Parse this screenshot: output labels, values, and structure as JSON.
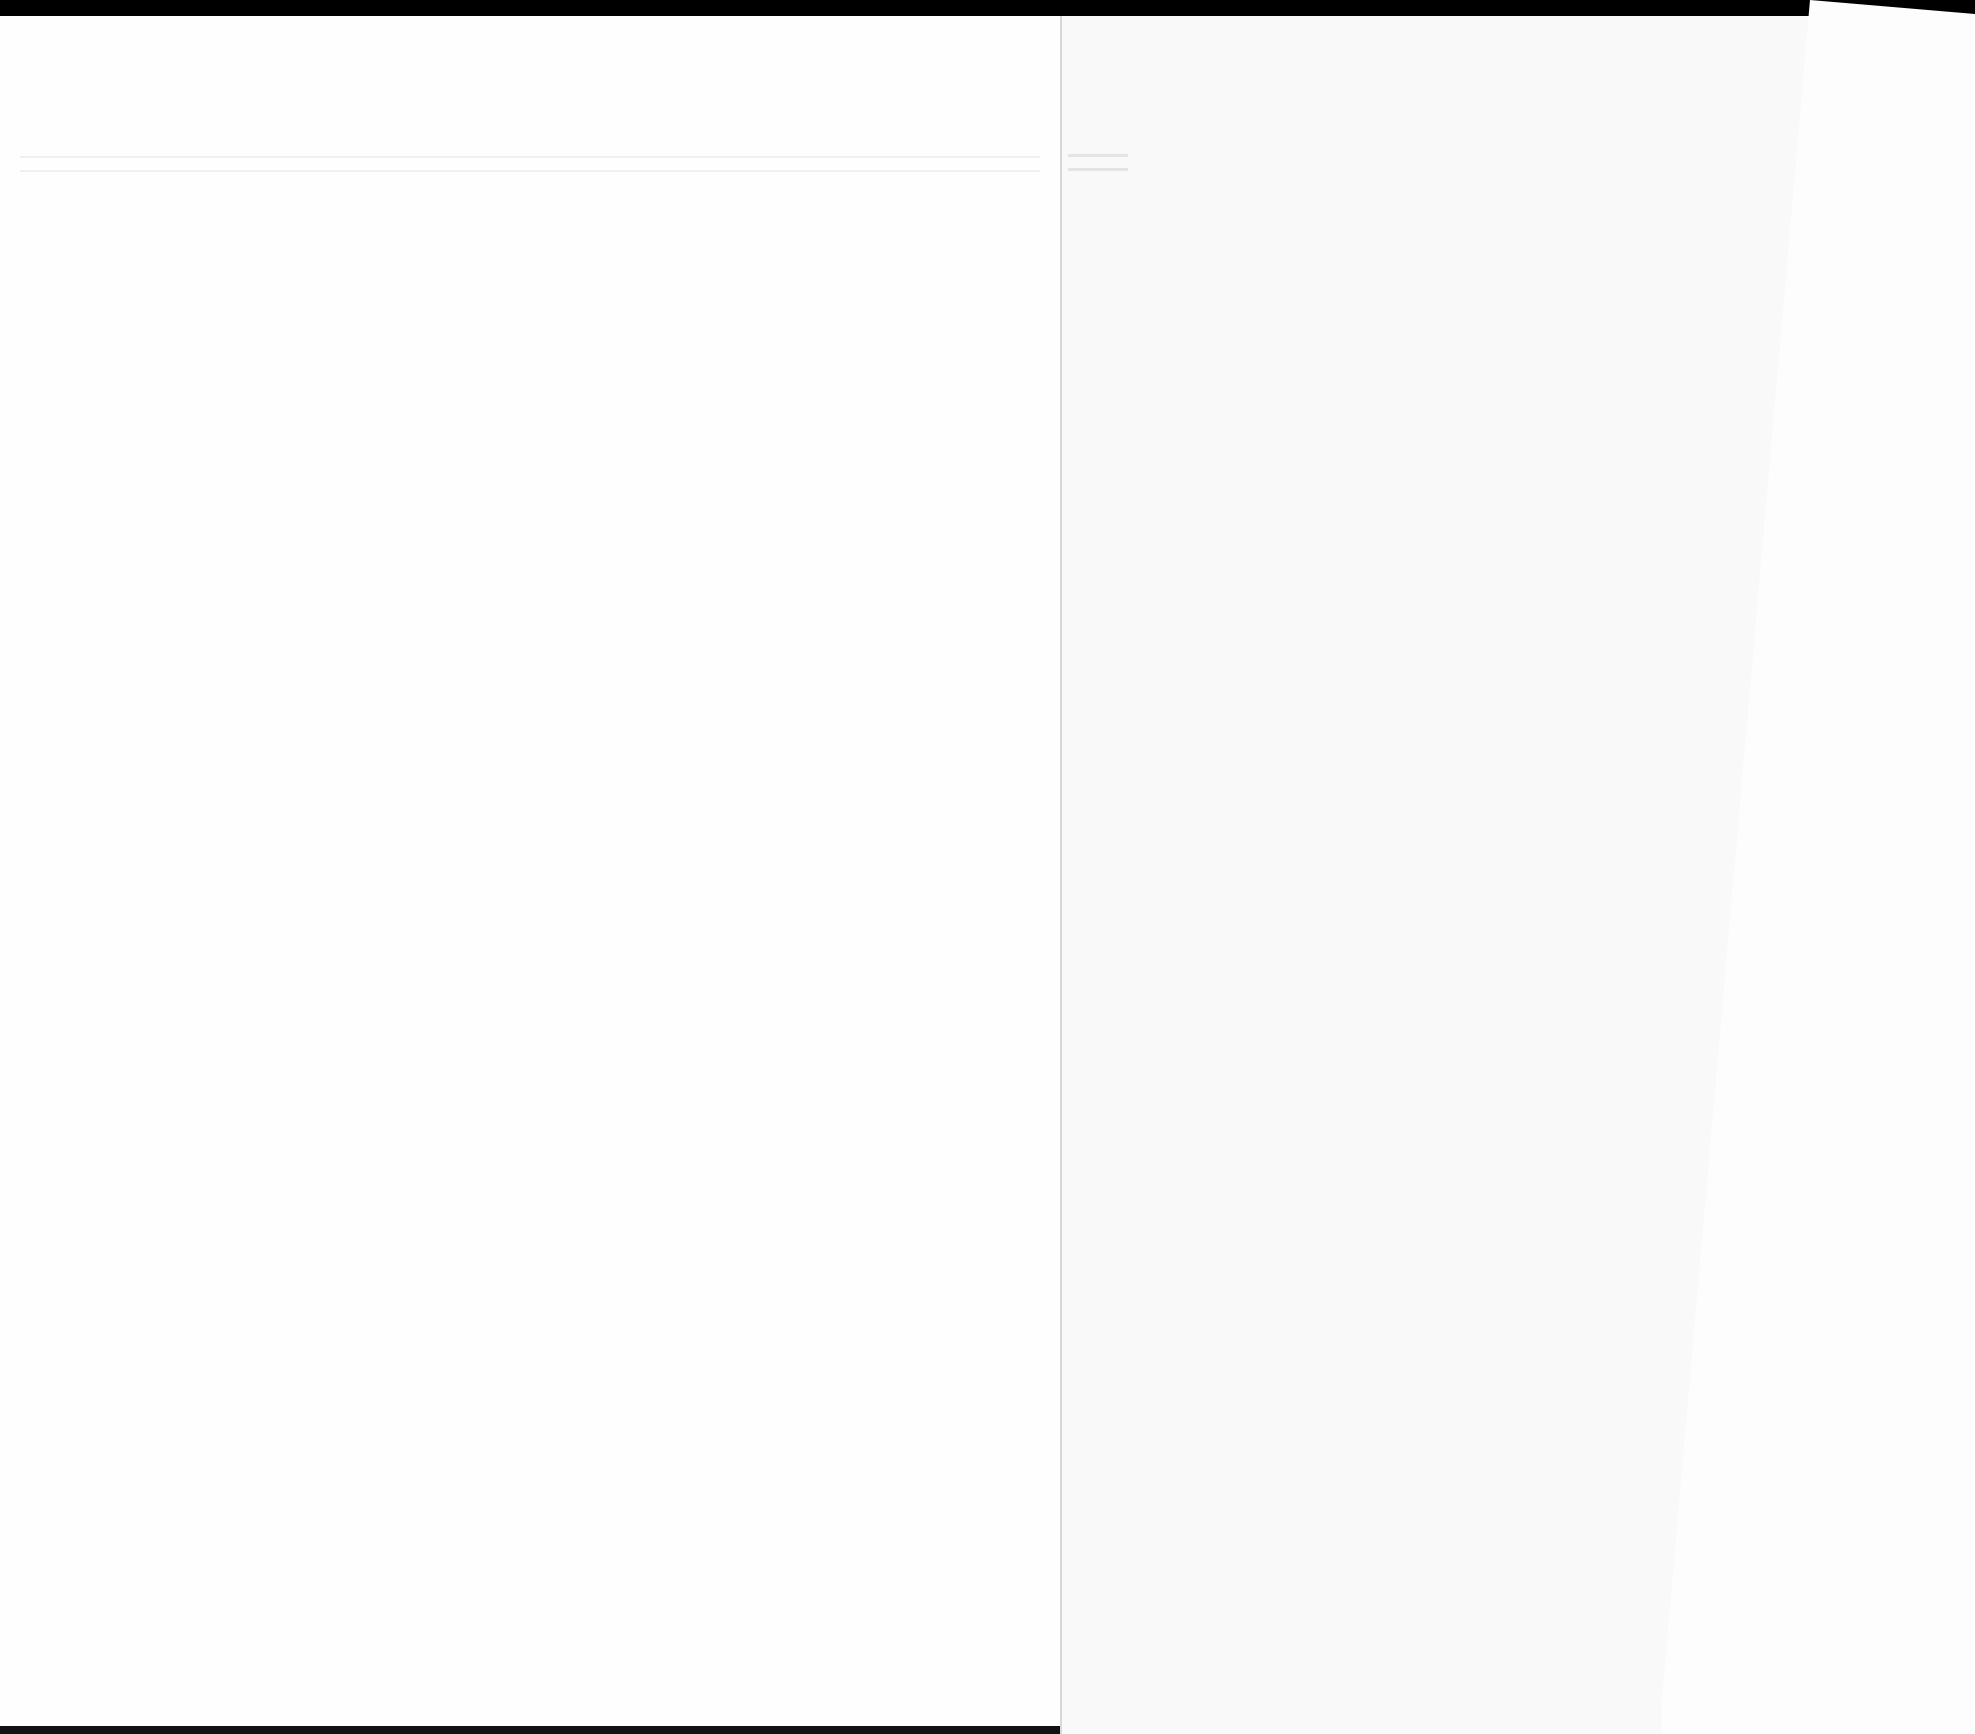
{
  "document": {
    "type": "scanned book spread",
    "left_page": {
      "text": ""
    },
    "right_page": {
      "text": ""
    },
    "insert_sheet": {
      "text": ""
    }
  },
  "colors": {
    "background": "#000000",
    "page": "#fefefe",
    "page_right": "#f9f9f9"
  }
}
